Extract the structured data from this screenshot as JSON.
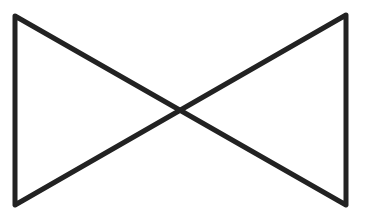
{
  "diagram": {
    "type": "bowtie-symbol",
    "stroke_color": "#222222",
    "background_color": "#ffffff",
    "stroke_width": 5,
    "vertices": {
      "top_left": [
        15,
        16
      ],
      "bottom_left": [
        15,
        205
      ],
      "top_right": [
        346,
        15
      ],
      "bottom_right": [
        346,
        205
      ],
      "center": [
        180,
        110
      ]
    }
  }
}
